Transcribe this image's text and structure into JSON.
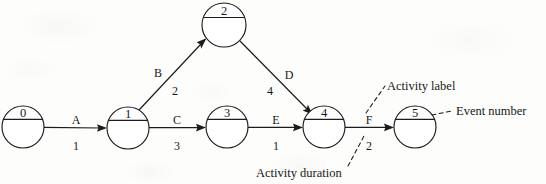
{
  "diagram": {
    "kind": "activity-on-arrow-network-diagram",
    "background_color": "#fdfdfc",
    "ink_color": "#1c1c1c",
    "nodes": [
      {
        "id": "n0",
        "event_number": "0",
        "cx": 23,
        "cy": 127,
        "r": 21
      },
      {
        "id": "n1",
        "event_number": "1",
        "cx": 128,
        "cy": 128,
        "r": 21
      },
      {
        "id": "n2",
        "event_number": "2",
        "cx": 224,
        "cy": 25,
        "r": 22
      },
      {
        "id": "n3",
        "event_number": "3",
        "cx": 227,
        "cy": 127,
        "r": 21
      },
      {
        "id": "n4",
        "event_number": "4",
        "cx": 324,
        "cy": 127,
        "r": 21
      },
      {
        "id": "n5",
        "event_number": "5",
        "cx": 415,
        "cy": 127,
        "r": 21
      }
    ],
    "activities": [
      {
        "id": "aA",
        "label": "A",
        "duration": "1",
        "from": "n0",
        "to": "n1",
        "label_x": 76,
        "label_y": 124,
        "duration_x": 76,
        "duration_y": 150
      },
      {
        "id": "aB",
        "label": "B",
        "duration": "2",
        "from": "n1",
        "to": "n2",
        "label_x": 158,
        "label_y": 77,
        "duration_x": 175,
        "duration_y": 95
      },
      {
        "id": "aC",
        "label": "C",
        "duration": "3",
        "from": "n1",
        "to": "n3",
        "label_x": 177,
        "label_y": 124,
        "duration_x": 177,
        "duration_y": 150
      },
      {
        "id": "aD",
        "label": "D",
        "duration": "4",
        "from": "n2",
        "to": "n4",
        "label_x": 289,
        "label_y": 79,
        "duration_x": 270,
        "duration_y": 95
      },
      {
        "id": "aE",
        "label": "E",
        "duration": "1",
        "from": "n3",
        "to": "n4",
        "label_x": 276,
        "label_y": 124,
        "duration_x": 276,
        "duration_y": 150
      },
      {
        "id": "aF",
        "label": "F",
        "duration": "2",
        "from": "n4",
        "to": "n5",
        "label_x": 369,
        "label_y": 124,
        "duration_x": 369,
        "duration_y": 150
      }
    ],
    "annotations": [
      {
        "id": "ann-activity-label",
        "text": "Activity label",
        "x": 387,
        "y": 89
      },
      {
        "id": "ann-event-number",
        "text": "Event number",
        "x": 456,
        "y": 115
      },
      {
        "id": "ann-activity-duration",
        "text": "Activity duration",
        "x": 256,
        "y": 177
      }
    ]
  }
}
